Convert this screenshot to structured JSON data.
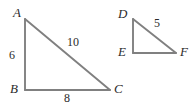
{
  "figure": {
    "background_color": "#ffffff",
    "stroke_color": "#808080",
    "text_color": "#2b2b2b",
    "triangles": [
      {
        "name": "triangle-abc",
        "vertices": [
          {
            "label": "A",
            "x": 25,
            "y": 19
          },
          {
            "label": "B",
            "x": 25,
            "y": 90
          },
          {
            "label": "C",
            "x": 110,
            "y": 90
          }
        ],
        "sides": [
          {
            "name": "AB",
            "length": "6"
          },
          {
            "name": "AC",
            "length": "10"
          },
          {
            "name": "BC",
            "length": "8"
          }
        ]
      },
      {
        "name": "triangle-def",
        "vertices": [
          {
            "label": "D",
            "x": 133,
            "y": 19
          },
          {
            "label": "E",
            "x": 133,
            "y": 53
          },
          {
            "label": "F",
            "x": 176,
            "y": 53
          }
        ],
        "sides": [
          {
            "name": "DF",
            "length": "5"
          }
        ]
      }
    ]
  }
}
